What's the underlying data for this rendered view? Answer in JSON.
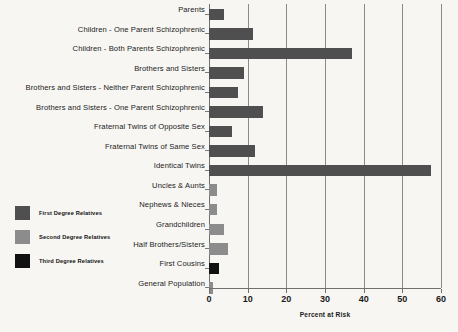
{
  "chart_data": {
    "type": "bar",
    "orientation": "horizontal",
    "title": "",
    "xlabel": "Percent at Risk",
    "ylabel": "",
    "xlim": [
      0,
      60
    ],
    "xticks": [
      0,
      10,
      20,
      30,
      40,
      50,
      60
    ],
    "grid": true,
    "legend_position": "left",
    "categories": [
      "Parents",
      "Children - One Parent  Schizophrenic",
      "Children - Both Parents Schizophrenic",
      "Brothers and Sisters",
      "Brothers and Sisters - Neither Parent Schizophrenic",
      "Brothers and Sisters - One Parent Schizophrenic",
      "Fraternal Twins of Opposite Sex",
      "Fraternal Twins of Same Sex",
      "Identical Twins",
      "Uncles  & Aunts",
      "Nephews & Nieces",
      "Grandchildren",
      "Half Brothers/Sisters",
      "First Cousins",
      "General Population"
    ],
    "values": [
      4,
      11.5,
      37,
      9,
      7.5,
      14,
      6,
      12,
      57.5,
      2,
      2,
      4,
      5,
      2.5,
      1
    ],
    "groups": [
      "first",
      "first",
      "first",
      "first",
      "first",
      "first",
      "first",
      "first",
      "first",
      "second",
      "second",
      "second",
      "second",
      "third",
      "second"
    ],
    "legend": [
      {
        "label": "First Degree Relatives",
        "key": "first",
        "color": "#4f4f4f"
      },
      {
        "label": "Second Degree Relatives",
        "key": "second",
        "color": "#8c8c8c"
      },
      {
        "label": "Third Degree Relatives",
        "key": "third",
        "color": "#111111"
      }
    ]
  },
  "colors": {
    "first": "#4f4f4f",
    "second": "#8c8c8c",
    "third": "#111111",
    "background": "#f7f6f3",
    "gridline": "#8a8a8a",
    "axis": "#6f6f6f"
  }
}
